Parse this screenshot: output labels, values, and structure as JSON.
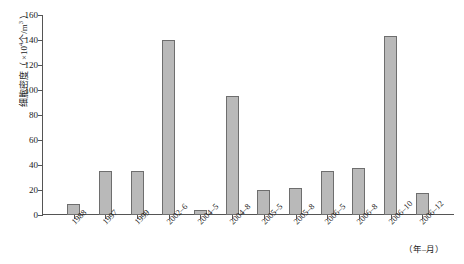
{
  "chart_data": {
    "type": "bar",
    "title": "",
    "subtitle": "",
    "xlabel": "（年–月）",
    "ylabel": "细胞密度（ ×10⁴个/m³ ）",
    "ylabel_parts": {
      "prefix": "细胞密度（ ×10",
      "exponent": "4",
      "suffix": "个/m",
      "exponent2": "3",
      "tail": " ）"
    },
    "categories": [
      "1988",
      "1997",
      "1999",
      "2002–6",
      "2004–5",
      "2004–8",
      "2005–5",
      "2005–8",
      "2006–5",
      "2006–8",
      "2006–10",
      "2006–12"
    ],
    "values": [
      9,
      35,
      35,
      140,
      4,
      95,
      20,
      22,
      35,
      38,
      143,
      18
    ],
    "ylim": [
      0,
      160
    ],
    "yticks": [
      0,
      20,
      40,
      60,
      80,
      100,
      120,
      140,
      160
    ],
    "ytick_labels": [
      "0",
      "20",
      "40",
      "60",
      "80",
      "100",
      "120",
      "140",
      "160"
    ],
    "grid": false,
    "legend": null,
    "bar_color": "#b9b9b9",
    "bar_edge_color": "#6e6e6e",
    "axis_color": "#555555"
  }
}
